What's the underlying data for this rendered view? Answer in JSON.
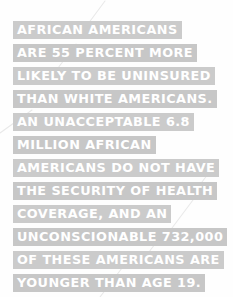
{
  "graphic": {
    "type": "quote-card",
    "background_color": "#fefefe",
    "highlight_color": "#c9c9c9",
    "text_color": "#ffffff",
    "decoration_color": "#e8e8e8",
    "full_text": "AFRICAN AMERICANS ARE 55 PERCENT MORE LIKELY TO BE UNINSURED THAN WHITE AMERICANS. AN UNACCEPTABLE 6.8 MILLION AFRICAN AMERICANS DO NOT HAVE THE SECURITY OF HEALTH COVERAGE, AND AN UNCONSCIONABLE 732,000 OF THESE AMERICANS ARE YOUNGER THAN AGE 19.",
    "lines": [
      {
        "text": "AFRICAN AMERICANS"
      },
      {
        "text": "ARE 55 PERCENT MORE"
      },
      {
        "text": "LIKELY TO BE UNINSURED"
      },
      {
        "text": "THAN WHITE AMERICANS."
      },
      {
        "text": "AN UNACCEPTABLE 6.8"
      },
      {
        "text": "MILLION AFRICAN"
      },
      {
        "text": "AMERICANS DO NOT HAVE"
      },
      {
        "text": "THE SECURITY OF HEALTH"
      },
      {
        "text": "COVERAGE, AND AN"
      },
      {
        "text": "UNCONSCIONABLE 732,000"
      },
      {
        "text": "OF THESE AMERICANS ARE"
      },
      {
        "text": "YOUNGER THAN AGE 19."
      }
    ],
    "statistics": {
      "percent_more_likely_uninsured": "55 PERCENT",
      "uninsured_count": "6.8 MILLION",
      "children_uninsured_count": "732,000",
      "age_threshold": "AGE 19"
    }
  }
}
